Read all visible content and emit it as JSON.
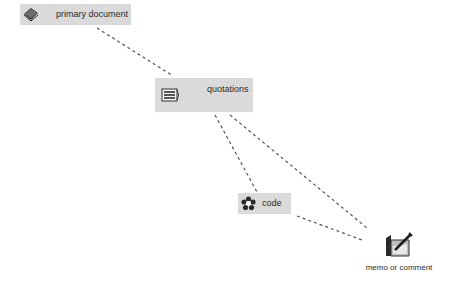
{
  "diagram": {
    "nodes": [
      {
        "id": "primary",
        "label": "primary document",
        "icon": "book-icon"
      },
      {
        "id": "quotations",
        "label": "quotations",
        "icon": "quotation-lines-icon"
      },
      {
        "id": "code",
        "label": "code",
        "icon": "flower-code-icon"
      },
      {
        "id": "memo",
        "label": "memo or comment",
        "icon": "pen-notepad-icon"
      }
    ],
    "edges": [
      {
        "from": "primary",
        "to": "quotations",
        "style": "dashed"
      },
      {
        "from": "quotations",
        "to": "code",
        "style": "dashed"
      },
      {
        "from": "quotations",
        "to": "memo",
        "style": "dashed"
      },
      {
        "from": "code",
        "to": "memo",
        "style": "dashed"
      }
    ]
  },
  "colors": {
    "node_fill": "#dadada",
    "text": "#2b2b2b",
    "edge": "#555555",
    "background": "#ffffff"
  }
}
